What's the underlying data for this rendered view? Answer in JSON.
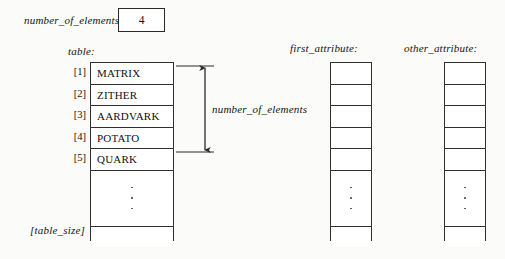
{
  "diagram": {
    "title_hidden": "",
    "variables": {
      "number_of_elements_label": "number_of_elements:",
      "number_of_elements_value": "4",
      "table_label": "table:",
      "first_attribute_label": "first_attribute:",
      "other_attribute_label": "other_attribute:",
      "table_size_label": "[table_size]"
    },
    "annotation": {
      "span_label": "number_of_elements",
      "spans_rows": [
        1,
        4
      ],
      "arrow_type": "double-headed-vertical"
    },
    "table": {
      "index_labels": [
        "[1]",
        "[2]",
        "[3]",
        "[4]",
        "[5]"
      ],
      "entries": [
        "MATRIX",
        "ZITHER",
        "AARDVARK",
        "POTATO",
        "QUARK"
      ],
      "ellipsis": "vertical-dots",
      "trailing_cell": ""
    },
    "first_attribute_column": {
      "cells": [
        "",
        "",
        "",
        "",
        ""
      ],
      "ellipsis": "vertical-dots",
      "trailing_cell": ""
    },
    "other_attribute_column": {
      "cells": [
        "",
        "",
        "",
        "",
        ""
      ],
      "ellipsis": "vertical-dots",
      "trailing_cell": ""
    },
    "colors": {
      "background": "#fbfbf9",
      "ink": "#111111",
      "rule": "#2f2f2f",
      "cell_fill": "#ffffff"
    }
  }
}
